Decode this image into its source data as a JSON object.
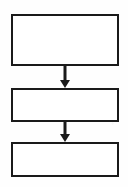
{
  "diagram": {
    "type": "flowchart",
    "orientation": "top-to-bottom",
    "background_color": "#fefefe",
    "stroke_color": "#1a1a1a",
    "fill_color": "#ffffff",
    "border_width_px": 2,
    "canvas": {
      "width": 128,
      "height": 187
    },
    "nodes": [
      {
        "id": "box-1",
        "shape": "rectangle",
        "label": "",
        "x": 11,
        "y": 14,
        "width": 108,
        "height": 52
      },
      {
        "id": "box-2",
        "shape": "rectangle",
        "label": "",
        "x": 11,
        "y": 88,
        "width": 108,
        "height": 34
      },
      {
        "id": "box-3",
        "shape": "rectangle",
        "label": "",
        "x": 11,
        "y": 142,
        "width": 108,
        "height": 35
      }
    ],
    "connectors": [
      {
        "id": "arrow-1",
        "from": "box-1",
        "to": "box-2",
        "label": "",
        "direction": "down",
        "arrowhead": "solid-triangle",
        "x": 56,
        "y": 66,
        "width": 18,
        "height": 22,
        "stem_x": 9,
        "stem_top": 0,
        "stem_bottom": 14,
        "stem_width": 3,
        "head_half_width": 5,
        "head_height": 8
      },
      {
        "id": "arrow-2",
        "from": "box-2",
        "to": "box-3",
        "label": "",
        "direction": "down",
        "arrowhead": "solid-triangle",
        "x": 56,
        "y": 122,
        "width": 18,
        "height": 20,
        "stem_x": 9,
        "stem_top": 0,
        "stem_bottom": 12,
        "stem_width": 3,
        "head_half_width": 5,
        "head_height": 8
      }
    ]
  }
}
